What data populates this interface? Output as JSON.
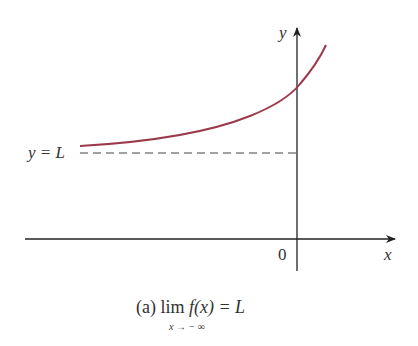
{
  "figure": {
    "caption": {
      "prefix": "(a) lim",
      "function": "f(x)",
      "equals": " = L",
      "subscript": "x → − ∞"
    },
    "axes": {
      "x_label": "x",
      "y_label": "y",
      "origin_label": "0"
    },
    "asymptote_label": "y = L",
    "colors": {
      "curve": "#9b3a4a",
      "axes": "#222222",
      "asymptote": "#444444",
      "text": "#333333"
    }
  }
}
